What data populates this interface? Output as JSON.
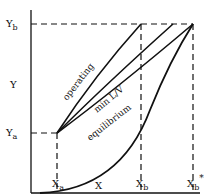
{
  "axes": {
    "y_label": "Y",
    "x_label": "X",
    "y_ticks": {
      "Yb": "Y",
      "Yb_sub": "b",
      "Ya": "Y",
      "Ya_sub": "a"
    },
    "x_ticks": {
      "Xa": "X",
      "Xa_sub": "a",
      "Xb": "X",
      "Xb_sub": "b",
      "Xbstar": "X",
      "Xbstar_sub": "b",
      "Xbstar_sup": "*"
    }
  },
  "curves": {
    "operating": "operating",
    "min_lv": "min L/V",
    "equilibrium": "equilibrium"
  },
  "colors": {
    "line": "#111111",
    "background": "#ffffff"
  }
}
